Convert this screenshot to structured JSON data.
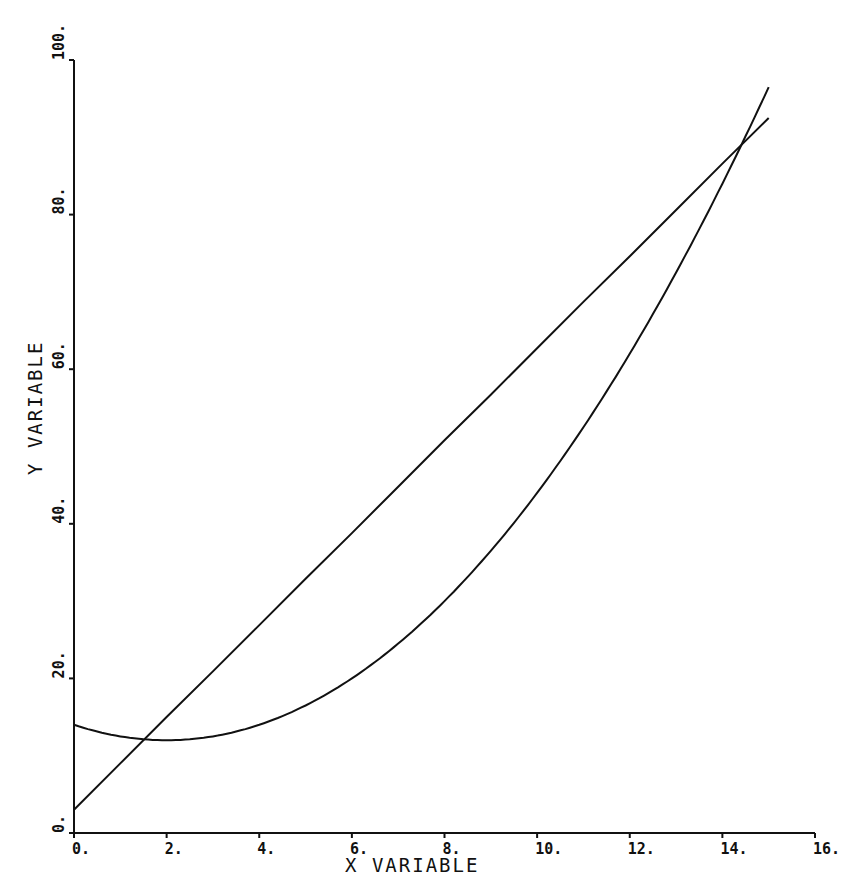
{
  "chart_data": {
    "type": "line",
    "title": "",
    "xlabel": "X VARIABLE",
    "ylabel": "Y VARIABLE",
    "xlim": [
      0,
      16
    ],
    "ylim": [
      0,
      100
    ],
    "x_ticks": [
      "0.",
      "2.",
      "4.",
      "6.",
      "8.",
      "10.",
      "12.",
      "14.",
      "16."
    ],
    "y_ticks": [
      "0.",
      "20.",
      "40.",
      "60.",
      "80.",
      "100."
    ],
    "grid": false,
    "legend": null,
    "series": [
      {
        "name": "linear",
        "x": [
          0,
          1,
          2,
          3,
          4,
          5,
          6,
          7,
          8,
          9,
          10,
          11,
          12,
          13,
          14,
          15
        ],
        "values": [
          3.0,
          9.0,
          15.0,
          20.9,
          26.9,
          32.9,
          38.8,
          44.8,
          50.8,
          56.7,
          62.7,
          68.7,
          74.6,
          80.6,
          86.6,
          92.5
        ]
      },
      {
        "name": "quadratic",
        "x": [
          0,
          1,
          2,
          3,
          4,
          5,
          6,
          7,
          8,
          9,
          10,
          11,
          12,
          13,
          14,
          15
        ],
        "values": [
          14.0,
          12.5,
          12.0,
          12.5,
          14.0,
          16.5,
          20.0,
          24.5,
          30.0,
          36.5,
          44.0,
          52.5,
          62.0,
          72.5,
          84.0,
          96.5
        ]
      }
    ],
    "intersections": [
      {
        "x": 1.5,
        "y": 12.1
      },
      {
        "x": 14.5,
        "y": 89.5
      }
    ]
  },
  "colors": {
    "ink": "#111111",
    "background": "#ffffff"
  }
}
